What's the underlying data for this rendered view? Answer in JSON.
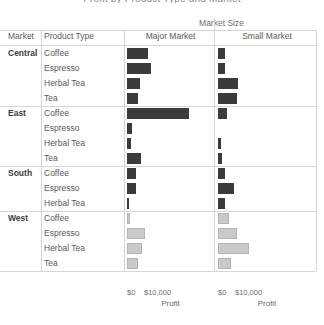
{
  "title": "Profit by Product Type and Market",
  "band_caption": "Market Size",
  "headers": {
    "market": "Market",
    "product_type": "Product Type",
    "major": "Major Market",
    "small": "Small Market"
  },
  "axis": {
    "tick_zero": "$0",
    "tick_ten": "$10,000",
    "label": "Profit"
  },
  "colors": {
    "dark_bar": "#3b3b3b",
    "light_bar": "#c9c9c9",
    "grid": "#d6d6d6",
    "text": "#5a5a5a"
  },
  "chart_data": {
    "type": "bar",
    "title": "Profit by Product Type and Market",
    "xlabel": "Profit",
    "ylabel": "",
    "xlim": [
      0,
      38000
    ],
    "xticks": [
      0,
      10000
    ],
    "xticklabels": [
      "$0",
      "$10,000"
    ],
    "grid": false,
    "legend": "none",
    "column_field": "Market Size",
    "columns": [
      "Major Market",
      "Small Market"
    ],
    "row_fields": [
      "Market",
      "Product Type"
    ],
    "series": [
      {
        "market": "Central",
        "color": "#3b3b3b",
        "rows": [
          {
            "product_type": "Coffee",
            "major_market": 12600,
            "small_market": 4300
          },
          {
            "product_type": "Espresso",
            "major_market": 14200,
            "small_market": 4100
          },
          {
            "product_type": "Herbal Tea",
            "major_market": 7800,
            "small_market": 11800
          },
          {
            "product_type": "Tea",
            "major_market": 6300,
            "small_market": 10900
          }
        ]
      },
      {
        "market": "East",
        "color": "#3b3b3b",
        "rows": [
          {
            "product_type": "Coffee",
            "major_market": 36500,
            "small_market": 5100
          },
          {
            "product_type": "Espresso",
            "major_market": 3000,
            "small_market": 0
          },
          {
            "product_type": "Herbal Tea",
            "major_market": 2500,
            "small_market": 2000
          },
          {
            "product_type": "Tea",
            "major_market": 8300,
            "small_market": 2200
          }
        ]
      },
      {
        "market": "South",
        "color": "#3b3b3b",
        "rows": [
          {
            "product_type": "Coffee",
            "major_market": 5200,
            "small_market": 4400
          },
          {
            "product_type": "Espresso",
            "major_market": 5400,
            "small_market": 9400
          },
          {
            "product_type": "Herbal Tea",
            "major_market": 700,
            "small_market": 4200
          }
        ]
      },
      {
        "market": "West",
        "color": "#c9c9c9",
        "rows": [
          {
            "product_type": "Coffee",
            "major_market": 1500,
            "small_market": 6400
          },
          {
            "product_type": "Espresso",
            "major_market": 10600,
            "small_market": 11300
          },
          {
            "product_type": "Herbal Tea",
            "major_market": 9100,
            "small_market": 18500
          },
          {
            "product_type": "Tea",
            "major_market": 6400,
            "small_market": 7600
          }
        ]
      }
    ]
  }
}
